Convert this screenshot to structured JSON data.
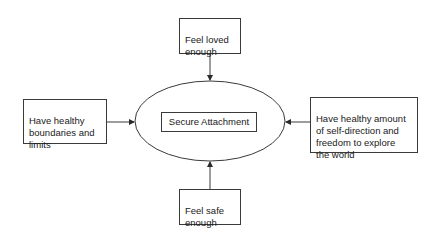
{
  "diagram": {
    "center": {
      "label": "Secure Attachment"
    },
    "nodes": {
      "top": {
        "label": "Feel loved\nenough"
      },
      "left": {
        "label": "Have healthy\nboundaries and\nlimits"
      },
      "right": {
        "label": "Have healthy amount\nof self-direction and\nfreedom to explore\nthe world"
      },
      "bottom": {
        "label": "Feel safe\nenough"
      }
    },
    "edges": [
      {
        "from": "top",
        "to": "center"
      },
      {
        "from": "left",
        "to": "center"
      },
      {
        "from": "right",
        "to": "center"
      },
      {
        "from": "bottom",
        "to": "center"
      }
    ],
    "colors": {
      "stroke": "#3a3a3a",
      "background": "#ffffff"
    }
  }
}
